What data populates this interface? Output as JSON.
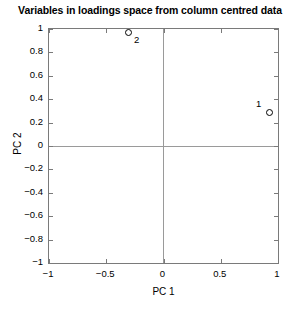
{
  "chart_data": {
    "type": "scatter",
    "title": "Variables in loadings space from column centred data",
    "xlabel": "PC 1",
    "ylabel": "PC 2",
    "xlim": [
      -1,
      1
    ],
    "ylim": [
      -1,
      1
    ],
    "grid": false,
    "legend": "none",
    "xticks": [
      "-1",
      "-0.5",
      "0",
      "0.5",
      "1"
    ],
    "xtick_values": [
      -1,
      -0.5,
      0,
      0.5,
      1
    ],
    "yticks": [
      "1",
      "0.8",
      "0.6",
      "0.4",
      "0.2",
      "0",
      "-0.2",
      "-0.4",
      "-0.6",
      "-0.8",
      "-1"
    ],
    "ytick_values": [
      1,
      0.8,
      0.6,
      0.4,
      0.2,
      0,
      -0.2,
      -0.4,
      -0.6,
      -0.8,
      -1
    ],
    "points": [
      {
        "label": "1",
        "x": 0.93,
        "y": 0.29
      },
      {
        "label": "2",
        "x": -0.31,
        "y": 0.97
      }
    ],
    "marker": "open-circle",
    "marker_color": "#000000",
    "axis_color": "#7a7a7a",
    "zero_line_color": "#9a9a9a",
    "background": "#ffffff"
  }
}
